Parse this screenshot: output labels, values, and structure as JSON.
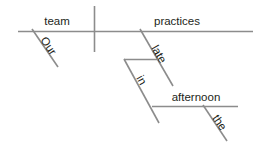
{
  "diagram": {
    "type": "reed-kellogg-sentence-diagram",
    "sentence": "Our team practices late in the afternoon.",
    "colors": {
      "line": "#8c8c8c",
      "text": "#231f20",
      "background": "#ffffff"
    },
    "words": {
      "subject": "team",
      "subject_modifier": "Our",
      "verb": "practices",
      "adverb": "late",
      "preposition": "in",
      "object_of_preposition": "afternoon",
      "article": "the"
    },
    "labels": [
      {
        "id": "subject",
        "text": "team",
        "role": "subject",
        "orientation": "horizontal"
      },
      {
        "id": "verb",
        "text": "practices",
        "role": "verb",
        "orientation": "horizontal"
      },
      {
        "id": "subject-modifier",
        "text": "Our",
        "role": "possessive-adjective",
        "orientation": "slanted"
      },
      {
        "id": "adverb",
        "text": "late",
        "role": "adverb",
        "orientation": "slanted"
      },
      {
        "id": "preposition",
        "text": "in",
        "role": "preposition",
        "orientation": "slanted"
      },
      {
        "id": "object-of-preposition",
        "text": "afternoon",
        "role": "object-of-preposition",
        "orientation": "horizontal"
      },
      {
        "id": "article",
        "text": "the",
        "role": "article",
        "orientation": "slanted"
      }
    ]
  }
}
